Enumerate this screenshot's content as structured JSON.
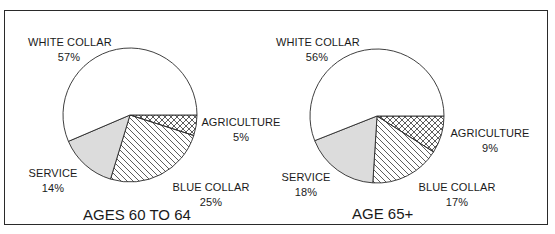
{
  "chart_data": [
    {
      "type": "pie",
      "title": "AGES 60 TO 64",
      "categories": [
        "AGRICULTURE",
        "BLUE COLLAR",
        "SERVICE",
        "WHITE COLLAR"
      ],
      "values": [
        5,
        25,
        14,
        57
      ],
      "labels": [
        "5%",
        "25%",
        "14%",
        "57%"
      ],
      "fills": {
        "AGRICULTURE": "crosshatch",
        "BLUE COLLAR": "diagonal-hatch",
        "SERVICE": "#dcdcdc",
        "WHITE COLLAR": "#ffffff"
      },
      "start_angle": "3 o'clock, clockwise"
    },
    {
      "type": "pie",
      "title": "AGE 65+",
      "categories": [
        "AGRICULTURE",
        "BLUE COLLAR",
        "SERVICE",
        "WHITE COLLAR"
      ],
      "values": [
        9,
        17,
        18,
        56
      ],
      "labels": [
        "9%",
        "17%",
        "18%",
        "56%"
      ],
      "fills": {
        "AGRICULTURE": "crosshatch",
        "BLUE COLLAR": "diagonal-hatch",
        "SERVICE": "#dcdcdc",
        "WHITE COLLAR": "#ffffff"
      },
      "start_angle": "3 o'clock, clockwise"
    }
  ],
  "left": {
    "title": "AGES 60 TO 64",
    "white_collar": {
      "name": "WHITE COLLAR",
      "pct": "57%"
    },
    "agriculture": {
      "name": "AGRICULTURE",
      "pct": "5%"
    },
    "service": {
      "name": "SERVICE",
      "pct": "14%"
    },
    "blue_collar": {
      "name": "BLUE COLLAR",
      "pct": "25%"
    }
  },
  "right": {
    "title": "AGE 65+",
    "white_collar": {
      "name": "WHITE COLLAR",
      "pct": "56%"
    },
    "agriculture": {
      "name": "AGRICULTURE",
      "pct": "9%"
    },
    "service": {
      "name": "SERVICE",
      "pct": "18%"
    },
    "blue_collar": {
      "name": "BLUE COLLAR",
      "pct": "17%"
    }
  },
  "colors": {
    "outline": "#2a2a2a",
    "service_fill": "#dcdcdc",
    "background": "#ffffff"
  }
}
